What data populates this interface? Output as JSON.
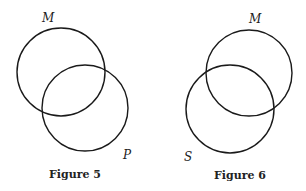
{
  "figures": [
    {
      "caption": "Figure 5",
      "circles": [
        {
          "label": "M",
          "cx": 61,
          "cy": 72,
          "r": 44
        },
        {
          "label": "P",
          "cx": 85,
          "cy": 108,
          "r": 43
        }
      ]
    },
    {
      "caption": "Figure 6",
      "circles": [
        {
          "label": "M",
          "cx": 249,
          "cy": 73,
          "r": 43
        },
        {
          "label": "S",
          "cx": 230,
          "cy": 109,
          "r": 44
        }
      ]
    }
  ],
  "colors": {
    "stroke": "#1a1a1a",
    "background": "#ffffff"
  }
}
